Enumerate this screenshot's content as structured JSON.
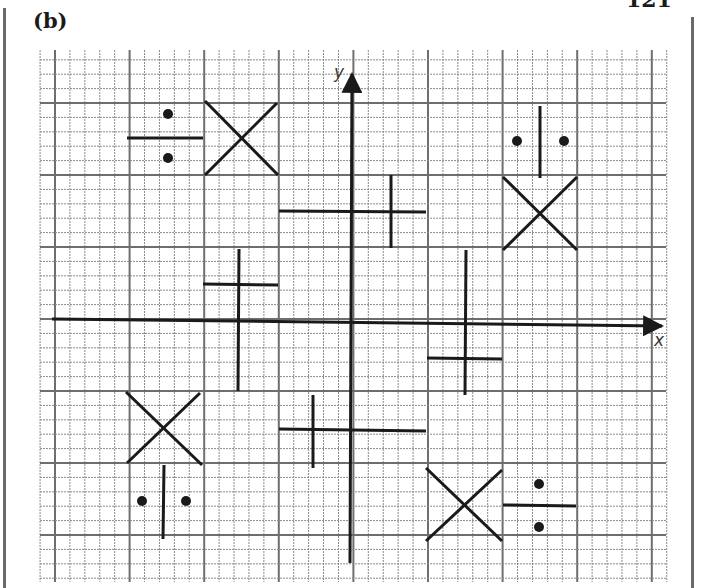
{
  "page": {
    "page_number": "121",
    "part_label": "(b)"
  },
  "figure": {
    "type": "coordinate-grid-with-shapes",
    "axes": {
      "x_label": "x",
      "y_label": "y"
    },
    "grid": {
      "minor_cells_per_major": 5,
      "line_color": "#8a8a8a",
      "major_line_color": "#6e6e6e"
    },
    "stroke_color": "#1a1a1a",
    "shapes": [
      {
        "kind": "division-sign",
        "position": "top-left",
        "orientation": "horizontal"
      },
      {
        "kind": "multiplication-sign",
        "position": "top-left"
      },
      {
        "kind": "plus-sign",
        "position": "top-center",
        "variant": "long-horizontal"
      },
      {
        "kind": "division-sign",
        "position": "top-right",
        "orientation": "vertical"
      },
      {
        "kind": "multiplication-sign",
        "position": "top-right"
      },
      {
        "kind": "plus-sign",
        "position": "middle-left",
        "variant": "long-vertical"
      },
      {
        "kind": "plus-sign",
        "position": "middle-right",
        "variant": "long-vertical"
      },
      {
        "kind": "multiplication-sign",
        "position": "bottom-left"
      },
      {
        "kind": "division-sign",
        "position": "bottom-left",
        "orientation": "vertical"
      },
      {
        "kind": "plus-sign",
        "position": "bottom-center",
        "variant": "long-horizontal"
      },
      {
        "kind": "multiplication-sign",
        "position": "bottom-right"
      },
      {
        "kind": "division-sign",
        "position": "bottom-right",
        "orientation": "horizontal"
      }
    ]
  }
}
